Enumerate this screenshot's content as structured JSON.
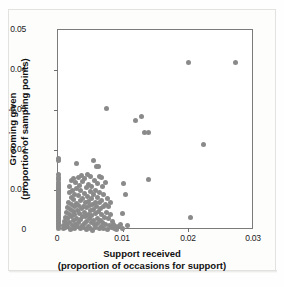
{
  "figure": {
    "background_color": "#fdfdfc",
    "point_color": "#8a8a8a",
    "axis_color": "#7b7b7b"
  },
  "chart_data": {
    "type": "scatter",
    "title": "",
    "xlabel": "Support received",
    "xlabel_sub": "(proportion of occasions for support)",
    "ylabel": "Grooming given",
    "ylabel_sub": "(proportion of sampling points)",
    "xlim": [
      0,
      0.03
    ],
    "ylim": [
      0,
      0.05
    ],
    "xticks": [
      0,
      0.01,
      0.02,
      0.03
    ],
    "xtick_labels": [
      "0",
      "0.01",
      "0.02",
      "0.03"
    ],
    "yticks": [
      0,
      0.01,
      0.02,
      0.03,
      0.04,
      0.05
    ],
    "ytick_labels": [
      "0",
      "0.01",
      "0.02",
      "0.03",
      "0.04",
      "0.05"
    ],
    "grid": false,
    "legend": null,
    "marker": "circle",
    "marker_color": "#8a8a8a",
    "points": [
      [
        0.0,
        0.0005
      ],
      [
        0.0,
        0.0009
      ],
      [
        0.0,
        0.0013
      ],
      [
        0.0,
        0.0017
      ],
      [
        0.0,
        0.0021
      ],
      [
        0.0,
        0.0025
      ],
      [
        0.0,
        0.0029
      ],
      [
        0.0,
        0.0033
      ],
      [
        0.0,
        0.0037
      ],
      [
        0.0,
        0.0041
      ],
      [
        0.0,
        0.0045
      ],
      [
        0.0,
        0.0049
      ],
      [
        0.0,
        0.0053
      ],
      [
        0.0,
        0.0057
      ],
      [
        0.0,
        0.0061
      ],
      [
        0.0,
        0.0065
      ],
      [
        0.0,
        0.0069
      ],
      [
        0.0,
        0.0073
      ],
      [
        0.0,
        0.0077
      ],
      [
        0.0,
        0.0081
      ],
      [
        0.0,
        0.0085
      ],
      [
        0.0,
        0.0089
      ],
      [
        0.0,
        0.0093
      ],
      [
        0.0,
        0.0097
      ],
      [
        0.0,
        0.0101
      ],
      [
        0.0,
        0.0105
      ],
      [
        0.0,
        0.011
      ],
      [
        0.0,
        0.0115
      ],
      [
        0.0,
        0.012
      ],
      [
        0.0,
        0.0126
      ],
      [
        0.0,
        0.0132
      ],
      [
        0.0,
        0.014
      ],
      [
        0.0,
        0.0175
      ],
      [
        0.0,
        0.018
      ],
      [
        0.0008,
        0.0003
      ],
      [
        0.0009,
        0.0012
      ],
      [
        0.001,
        0.0022
      ],
      [
        0.0011,
        0.0006
      ],
      [
        0.0012,
        0.0031
      ],
      [
        0.0013,
        0.0044
      ],
      [
        0.0013,
        0.0016
      ],
      [
        0.0014,
        0.0057
      ],
      [
        0.0015,
        0.0028
      ],
      [
        0.0015,
        0.0008
      ],
      [
        0.0016,
        0.007
      ],
      [
        0.0017,
        0.0039
      ],
      [
        0.0017,
        0.0095
      ],
      [
        0.0018,
        0.0019
      ],
      [
        0.0018,
        0.011
      ],
      [
        0.0019,
        0.0052
      ],
      [
        0.0019,
        0.0002
      ],
      [
        0.002,
        0.0082
      ],
      [
        0.002,
        0.0124
      ],
      [
        0.0021,
        0.0034
      ],
      [
        0.0021,
        0.0064
      ],
      [
        0.0022,
        0.0011
      ],
      [
        0.0022,
        0.01
      ],
      [
        0.0023,
        0.0046
      ],
      [
        0.0023,
        0.0128
      ],
      [
        0.0024,
        0.0076
      ],
      [
        0.0024,
        0.0023
      ],
      [
        0.0025,
        0.0058
      ],
      [
        0.0025,
        0.0005
      ],
      [
        0.0026,
        0.009
      ],
      [
        0.0026,
        0.0038
      ],
      [
        0.0027,
        0.0119
      ],
      [
        0.0027,
        0.0014
      ],
      [
        0.0028,
        0.0066
      ],
      [
        0.0028,
        0.0166
      ],
      [
        0.0029,
        0.003
      ],
      [
        0.0029,
        0.0104
      ],
      [
        0.003,
        0.005
      ],
      [
        0.003,
        0.0008
      ],
      [
        0.0031,
        0.0086
      ],
      [
        0.0031,
        0.0132
      ],
      [
        0.0032,
        0.002
      ],
      [
        0.0032,
        0.0062
      ],
      [
        0.0033,
        0.0042
      ],
      [
        0.0033,
        0.0112
      ],
      [
        0.0034,
        0.0003
      ],
      [
        0.0034,
        0.0074
      ],
      [
        0.0035,
        0.0026
      ],
      [
        0.0035,
        0.0098
      ],
      [
        0.0036,
        0.0054
      ],
      [
        0.0036,
        0.0136
      ],
      [
        0.0037,
        0.0012
      ],
      [
        0.0037,
        0.008
      ],
      [
        0.0038,
        0.0035
      ],
      [
        0.0038,
        0.0121
      ],
      [
        0.0039,
        0.006
      ],
      [
        0.0039,
        0.0006
      ],
      [
        0.004,
        0.0092
      ],
      [
        0.004,
        0.0045
      ],
      [
        0.0041,
        0.0017
      ],
      [
        0.0041,
        0.0128
      ],
      [
        0.0042,
        0.0068
      ],
      [
        0.0042,
        0.0033
      ],
      [
        0.0043,
        0.0106
      ],
      [
        0.0043,
        0.0002
      ],
      [
        0.0044,
        0.0056
      ],
      [
        0.0044,
        0.0022
      ],
      [
        0.0045,
        0.0084
      ],
      [
        0.0045,
        0.014
      ],
      [
        0.0046,
        0.004
      ],
      [
        0.0046,
        0.001
      ],
      [
        0.0047,
        0.0072
      ],
      [
        0.0047,
        0.0115
      ],
      [
        0.0048,
        0.0029
      ],
      [
        0.0048,
        0.0062
      ],
      [
        0.0049,
        0.0096
      ],
      [
        0.0049,
        0.0005
      ],
      [
        0.005,
        0.0048
      ],
      [
        0.005,
        0.0134
      ],
      [
        0.0051,
        0.0018
      ],
      [
        0.0051,
        0.0078
      ],
      [
        0.0052,
        0.0036
      ],
      [
        0.0052,
        0.0108
      ],
      [
        0.0053,
        0.0064
      ],
      [
        0.0053,
        0.0
      ],
      [
        0.0054,
        0.0025
      ],
      [
        0.0054,
        0.0089
      ],
      [
        0.0055,
        0.0052
      ],
      [
        0.0055,
        0.0175
      ],
      [
        0.0056,
        0.0013
      ],
      [
        0.0056,
        0.0125
      ],
      [
        0.0057,
        0.007
      ],
      [
        0.0057,
        0.0041
      ],
      [
        0.0058,
        0.01
      ],
      [
        0.0058,
        0.0007
      ],
      [
        0.0059,
        0.0058
      ],
      [
        0.0059,
        0.0158
      ],
      [
        0.006,
        0.003
      ],
      [
        0.006,
        0.0082
      ],
      [
        0.0061,
        0.0117
      ],
      [
        0.0061,
        0.0016
      ],
      [
        0.0062,
        0.0046
      ],
      [
        0.0062,
        0.016
      ],
      [
        0.0063,
        0.0068
      ],
      [
        0.0063,
        0.0003
      ],
      [
        0.0064,
        0.0095
      ],
      [
        0.0064,
        0.0135
      ],
      [
        0.0065,
        0.0024
      ],
      [
        0.0065,
        0.0055
      ],
      [
        0.0066,
        0.0131
      ],
      [
        0.0066,
        0.0009
      ],
      [
        0.0067,
        0.0074
      ],
      [
        0.0067,
        0.0038
      ],
      [
        0.0068,
        0.0108
      ],
      [
        0.0068,
        0.0019
      ],
      [
        0.0069,
        0.006
      ],
      [
        0.007,
        0.0088
      ],
      [
        0.007,
        0.0005
      ],
      [
        0.0071,
        0.0032
      ],
      [
        0.0072,
        0.012
      ],
      [
        0.0072,
        0.0065
      ],
      [
        0.0073,
        0.0014
      ],
      [
        0.0074,
        0.0045
      ],
      [
        0.0074,
        0.0304
      ],
      [
        0.0075,
        0.0078
      ],
      [
        0.0076,
        0.0002
      ],
      [
        0.0077,
        0.0028
      ],
      [
        0.0078,
        0.0058
      ],
      [
        0.0079,
        0.0011
      ],
      [
        0.008,
        0.007
      ],
      [
        0.0081,
        0.0038
      ],
      [
        0.0082,
        0.0006
      ],
      [
        0.0083,
        0.0022
      ],
      [
        0.0085,
        0.0015
      ],
      [
        0.0086,
        0.0004
      ],
      [
        0.0088,
        0.001
      ],
      [
        0.009,
        0.0002
      ],
      [
        0.0092,
        0.0008
      ],
      [
        0.0095,
        0.0013
      ],
      [
        0.0098,
        0.0042
      ],
      [
        0.0099,
        0.0003
      ],
      [
        0.0101,
        0.0117
      ],
      [
        0.0103,
        0.009
      ],
      [
        0.0106,
        0.0012
      ],
      [
        0.0118,
        0.0275
      ],
      [
        0.0128,
        0.0283
      ],
      [
        0.0133,
        0.0245
      ],
      [
        0.0138,
        0.0245
      ],
      [
        0.0139,
        0.0127
      ],
      [
        0.02,
        0.042
      ],
      [
        0.0203,
        0.0032
      ],
      [
        0.0222,
        0.0214
      ],
      [
        0.0272,
        0.042
      ]
    ]
  }
}
